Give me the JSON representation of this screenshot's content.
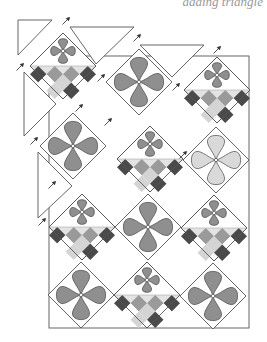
{
  "caption": "adding triangle",
  "colors": {
    "stroke": "#555555",
    "petal_dark": "#8f8f8f",
    "petal_light": "#d9d9d9",
    "checker_dark": "#4a4a4a",
    "checker_mid": "#9a9a9a",
    "checker_light": "#d4d4d4",
    "checker_white": "#ffffff",
    "checker_top": "#e3e3e3"
  },
  "diagram": {
    "type": "quilt-assembly-diagonal-rows",
    "half_diagonal": 33,
    "blocks": [
      {
        "id": "A",
        "cx": 63,
        "cy": 66,
        "kind": "small-flower-checker"
      },
      {
        "id": "B",
        "cx": 139,
        "cy": 82,
        "kind": "big-flower",
        "shade": "dark"
      },
      {
        "id": "C",
        "cx": 217,
        "cy": 90,
        "kind": "small-flower-checker"
      },
      {
        "id": "D",
        "cx": 73,
        "cy": 146,
        "kind": "big-flower",
        "shade": "dark"
      },
      {
        "id": "E",
        "cx": 150,
        "cy": 159,
        "kind": "small-flower-checker"
      },
      {
        "id": "F",
        "cx": 216,
        "cy": 160,
        "kind": "big-flower",
        "shade": "light"
      },
      {
        "id": "G",
        "cx": 82,
        "cy": 227,
        "kind": "small-flower-checker"
      },
      {
        "id": "H",
        "cx": 148,
        "cy": 227,
        "kind": "big-flower",
        "shade": "dark"
      },
      {
        "id": "I",
        "cx": 214,
        "cy": 228,
        "kind": "small-flower-checker"
      },
      {
        "id": "J",
        "cx": 81,
        "cy": 295,
        "kind": "big-flower",
        "shade": "dark"
      },
      {
        "id": "K",
        "cx": 147,
        "cy": 295,
        "kind": "small-flower-checker"
      },
      {
        "id": "L",
        "cx": 213,
        "cy": 296,
        "kind": "big-flower",
        "shade": "dark"
      }
    ],
    "setting_triangles": [
      {
        "points": "18,20 52,20 18,55"
      },
      {
        "points": "70,27 134,27 96,64"
      },
      {
        "points": "140,45 204,45 172,77"
      },
      {
        "points": "24,72 56,104 24,136"
      },
      {
        "points": "38,152 38,218 72,186"
      }
    ],
    "arrow_markers": [
      {
        "x": 66,
        "y": 21
      },
      {
        "x": 137,
        "y": 38
      },
      {
        "x": 217,
        "y": 50
      },
      {
        "x": 20,
        "y": 67
      },
      {
        "x": 101,
        "y": 78
      },
      {
        "x": 176,
        "y": 87
      },
      {
        "x": 34,
        "y": 141
      },
      {
        "x": 108,
        "y": 122
      },
      {
        "x": 183,
        "y": 155
      },
      {
        "x": 42,
        "y": 222
      },
      {
        "x": 52,
        "y": 185
      },
      {
        "x": 79,
        "y": 108
      }
    ],
    "frame": {
      "x": 49,
      "y": 56,
      "w": 200,
      "h": 272
    }
  }
}
